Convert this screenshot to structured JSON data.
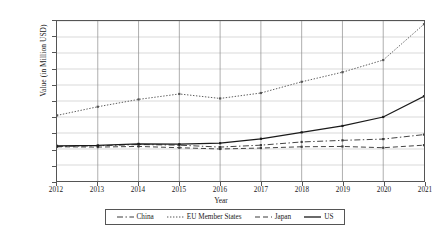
{
  "chart_data": {
    "type": "line",
    "title": "",
    "xlabel": "Year",
    "ylabel": "Value (in Million USD)",
    "x": [
      2012,
      2013,
      2014,
      2015,
      2016,
      2017,
      2018,
      2019,
      2020,
      2021
    ],
    "xtick_labels": [
      "2012",
      "2013",
      "2014",
      "2015",
      "2016",
      "2017",
      "2018",
      "2019",
      "2020",
      "2021"
    ],
    "ytick_labels": [
      "0",
      "50,000",
      "100,000",
      "150,000",
      "200,000",
      "250,000",
      "300,000",
      "350,000",
      "400,000",
      "450,000",
      "500,000"
    ],
    "ytick_values": [
      0,
      50000,
      100000,
      150000,
      200000,
      250000,
      300000,
      350000,
      400000,
      450000,
      500000
    ],
    "ylim": [
      0,
      500000
    ],
    "xlim": [
      2012,
      2021
    ],
    "grid": true,
    "legend_position": "bottom",
    "series": [
      {
        "name": "China",
        "style": "dash-dot",
        "color": "#3a3a3a",
        "values": [
          108000,
          110000,
          114000,
          112000,
          106000,
          112000,
          122000,
          127000,
          131000,
          145000
        ]
      },
      {
        "name": "EU Member States",
        "style": "dotted",
        "color": "#555555",
        "values": [
          205000,
          232000,
          255000,
          272000,
          258000,
          275000,
          310000,
          340000,
          378000,
          490000
        ]
      },
      {
        "name": "Japan",
        "style": "dashed",
        "color": "#3a3a3a",
        "values": [
          107000,
          106000,
          108000,
          104000,
          100000,
          103000,
          107000,
          108000,
          104000,
          112000
        ]
      },
      {
        "name": "US",
        "style": "solid",
        "color": "#1a1a1a",
        "values": [
          110000,
          111000,
          116000,
          115000,
          118000,
          132000,
          152000,
          172000,
          200000,
          265000
        ]
      }
    ]
  }
}
